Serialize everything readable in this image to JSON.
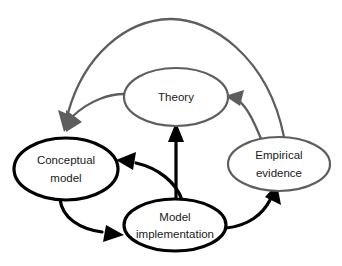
{
  "diagram": {
    "background_color": "#ffffff",
    "colors": {
      "primary_stroke": "#000000",
      "secondary_stroke": "#5e5e5e",
      "text": "#1a1a1a",
      "background": "#ffffff"
    },
    "nodes": [
      {
        "id": "theory",
        "label": "Theory",
        "lines": [
          "Theory"
        ],
        "emphasis": "secondary",
        "stroke_color": "#5e5e5e",
        "cx": 176,
        "cy": 97,
        "rx": 52,
        "ry": 29
      },
      {
        "id": "conceptual-model",
        "label": "Conceptual model",
        "lines": [
          "Conceptual",
          "model"
        ],
        "emphasis": "primary",
        "stroke_color": "#000000",
        "cx": 66,
        "cy": 169,
        "rx": 52,
        "ry": 31
      },
      {
        "id": "empirical-evidence",
        "label": "Empirical evidence",
        "lines": [
          "Empirical",
          "evidence"
        ],
        "emphasis": "secondary",
        "stroke_color": "#5e5e5e",
        "cx": 279,
        "cy": 164,
        "rx": 51,
        "ry": 27
      },
      {
        "id": "model-implementation",
        "label": "Model implementation",
        "lines": [
          "Model",
          "implementation"
        ],
        "emphasis": "primary",
        "stroke_color": "#000000",
        "cx": 175,
        "cy": 225,
        "rx": 51,
        "ry": 26
      }
    ],
    "edges": [
      {
        "id": "edge-model-implementation-to-theory",
        "from": "model-implementation",
        "to": "theory",
        "style": "black",
        "shape": "straight-vertical",
        "label": ""
      },
      {
        "id": "edge-model-implementation-to-conceptual-model",
        "from": "model-implementation",
        "to": "conceptual-model",
        "style": "black",
        "shape": "curve",
        "label": ""
      },
      {
        "id": "edge-conceptual-model-to-model-implementation",
        "from": "conceptual-model",
        "to": "model-implementation",
        "style": "black",
        "shape": "curve",
        "label": ""
      },
      {
        "id": "edge-model-implementation-to-empirical-evidence",
        "from": "model-implementation",
        "to": "empirical-evidence",
        "style": "black",
        "shape": "curve",
        "label": ""
      },
      {
        "id": "edge-empirical-evidence-to-theory",
        "from": "empirical-evidence",
        "to": "theory",
        "style": "gray",
        "shape": "curve",
        "label": ""
      },
      {
        "id": "edge-theory-to-conceptual-model",
        "from": "theory",
        "to": "conceptual-model",
        "style": "gray",
        "shape": "curve",
        "label": ""
      },
      {
        "id": "edge-empirical-evidence-to-conceptual-model",
        "from": "empirical-evidence",
        "to": "conceptual-model",
        "style": "gray",
        "shape": "arc-over-top",
        "label": ""
      }
    ]
  }
}
